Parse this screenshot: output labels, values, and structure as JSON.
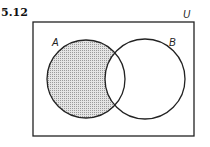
{
  "problem_number": "5.12",
  "universe_label": "U",
  "sets": [
    {
      "name": "A",
      "cx": 86,
      "cy": 79,
      "r": 39
    },
    {
      "name": "B",
      "cx": 145,
      "cy": 79,
      "r": 40
    }
  ],
  "shaded_region": "A minus B",
  "colors": {
    "stroke": "#222222",
    "shade": "#c8c8c8",
    "background": "#ffffff"
  }
}
